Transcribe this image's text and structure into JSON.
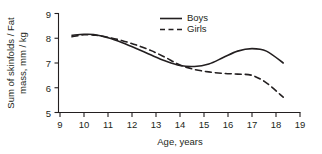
{
  "chart_data": {
    "type": "line",
    "title": "",
    "xlabel": "Age, years",
    "ylabel_line1": "Sum of skinfolds / Fat",
    "ylabel_line2": "mass, mm / kg",
    "xlim": [
      9,
      19
    ],
    "ylim": [
      5,
      9
    ],
    "xticks": [
      9,
      10,
      11,
      12,
      13,
      14,
      15,
      16,
      17,
      18,
      19
    ],
    "xtick_labels": [
      "9",
      "10",
      "11",
      "12",
      "13",
      "14",
      "15",
      "16",
      "17",
      "18",
      "19"
    ],
    "yticks": [
      5,
      6,
      7,
      8,
      9
    ],
    "ytick_labels": [
      "5",
      "6",
      "7",
      "8",
      "9"
    ],
    "grid": false,
    "legend_position": "top-right",
    "series": [
      {
        "name": "Boys",
        "style": "solid",
        "color": "#231f20",
        "x": [
          9.5,
          10.0,
          10.4,
          11.0,
          11.6,
          12.2,
          12.8,
          13.4,
          14.0,
          14.6,
          15.2,
          15.8,
          16.4,
          17.0,
          17.6,
          18.3
        ],
        "y": [
          8.12,
          8.16,
          8.15,
          8.02,
          7.82,
          7.58,
          7.32,
          7.08,
          6.9,
          6.86,
          6.96,
          7.22,
          7.48,
          7.58,
          7.48,
          7.0
        ]
      },
      {
        "name": "Girls",
        "style": "dashed",
        "color": "#231f20",
        "x": [
          9.5,
          10.0,
          10.5,
          11.0,
          11.6,
          12.2,
          12.8,
          13.4,
          14.0,
          14.6,
          15.2,
          15.8,
          16.4,
          17.0,
          17.6,
          18.3
        ],
        "y": [
          8.06,
          8.14,
          8.12,
          8.04,
          7.9,
          7.72,
          7.5,
          7.22,
          6.92,
          6.74,
          6.64,
          6.58,
          6.55,
          6.5,
          6.2,
          5.62
        ]
      }
    ],
    "legend_entries": [
      {
        "label": "Boys",
        "style": "solid"
      },
      {
        "label": "Girls",
        "style": "dashed"
      }
    ]
  }
}
